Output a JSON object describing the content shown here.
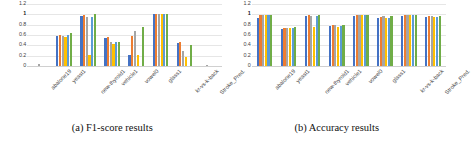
{
  "figure": {
    "panels": [
      {
        "caption": "(a) F1-score results",
        "chart_index": 0
      },
      {
        "caption": "(b) Accuracy results",
        "chart_index": 1
      }
    ]
  },
  "palette": {
    "series1": "#4472C4",
    "series2": "#ED7D31",
    "series3": "#A5A5A5",
    "series4": "#FFC000",
    "series5": "#5B9BD5",
    "series6": "#70AD47",
    "gridline": "#E6E6E6",
    "axis_text": "#3F3F3F"
  },
  "chart_data": [
    {
      "type": "bar",
      "title": "(a) F1-score results",
      "xlabel": "",
      "ylabel": "",
      "ylim": [
        0,
        1.2
      ],
      "yticks": [
        "0",
        "0.2",
        "0.4",
        "0.6",
        "0.8",
        "1",
        "1.2"
      ],
      "grid": true,
      "legend": "none",
      "categories": [
        "abalone19",
        "yeast1",
        "new-thyroid1",
        "vehicle1",
        "vowel0",
        "glass1",
        "kr-vs-k-back",
        "Stroke_Pred."
      ],
      "series": [
        {
          "name": "Series 1",
          "color": "#4472C4",
          "values": [
            0.0,
            0.59,
            0.96,
            0.55,
            0.21,
            1.0,
            0.45,
            0.0
          ]
        },
        {
          "name": "Series 2",
          "color": "#ED7D31",
          "values": [
            0.0,
            0.6,
            0.98,
            0.57,
            0.59,
            1.0,
            0.46,
            0.0
          ]
        },
        {
          "name": "Series 3",
          "color": "#A5A5A5",
          "values": [
            0.04,
            0.58,
            0.94,
            0.47,
            0.68,
            1.0,
            0.3,
            0.02
          ]
        },
        {
          "name": "Series 4",
          "color": "#FFC000",
          "values": [
            0.0,
            0.57,
            0.22,
            0.43,
            0.21,
            1.0,
            0.18,
            0.0
          ]
        },
        {
          "name": "Series 5",
          "color": "#5B9BD5",
          "values": [
            0.0,
            0.6,
            0.95,
            0.46,
            0.0,
            1.0,
            0.0,
            0.0
          ]
        },
        {
          "name": "Series 6",
          "color": "#70AD47",
          "values": [
            0.0,
            0.64,
            1.0,
            0.47,
            0.75,
            1.0,
            0.4,
            0.0
          ]
        }
      ]
    },
    {
      "type": "bar",
      "title": "(b) Accuracy results",
      "xlabel": "",
      "ylabel": "",
      "ylim": [
        0,
        1.2
      ],
      "yticks": [
        "0",
        "0.2",
        "0.4",
        "0.6",
        "0.8",
        "1",
        "1.2"
      ],
      "grid": true,
      "legend": "none",
      "categories": [
        "abalone19",
        "yeast1",
        "new-thyroid1",
        "vehicle1",
        "vowel0",
        "glass1",
        "kr-vs-k-back",
        "Stroke_Pred."
      ],
      "series": [
        {
          "name": "Series 1",
          "color": "#4472C4",
          "values": [
            0.92,
            0.72,
            0.96,
            0.78,
            0.97,
            0.93,
            0.97,
            0.95
          ]
        },
        {
          "name": "Series 2",
          "color": "#ED7D31",
          "values": [
            0.99,
            0.74,
            0.99,
            0.8,
            0.99,
            0.95,
            0.99,
            0.96
          ]
        },
        {
          "name": "Series 3",
          "color": "#A5A5A5",
          "values": [
            0.99,
            0.73,
            0.97,
            0.79,
            0.99,
            0.97,
            0.99,
            0.96
          ]
        },
        {
          "name": "Series 4",
          "color": "#FFC000",
          "values": [
            0.99,
            0.73,
            0.76,
            0.76,
            0.99,
            0.93,
            0.99,
            0.95
          ]
        },
        {
          "name": "Series 5",
          "color": "#5B9BD5",
          "values": [
            0.99,
            0.74,
            0.96,
            0.78,
            0.99,
            0.92,
            0.99,
            0.95
          ]
        },
        {
          "name": "Series 6",
          "color": "#70AD47",
          "values": [
            0.99,
            0.76,
            0.99,
            0.8,
            0.99,
            0.96,
            0.99,
            0.96
          ]
        }
      ]
    }
  ]
}
